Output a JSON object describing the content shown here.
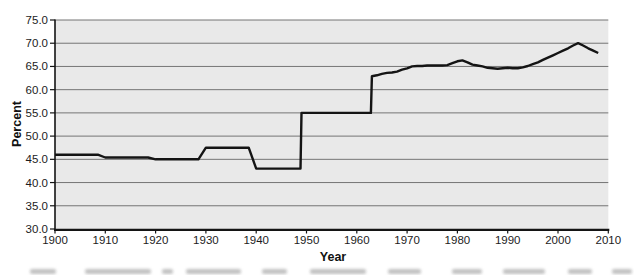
{
  "chart_data": {
    "type": "line",
    "xlabel": "Year",
    "ylabel": "Percent",
    "xlim": [
      1900,
      2010
    ],
    "ylim": [
      30,
      75
    ],
    "grid": "horizontal",
    "legend": "none",
    "x_tick_values": [
      1900,
      1910,
      1920,
      1930,
      1940,
      1950,
      1960,
      1970,
      1980,
      1990,
      2000,
      2010
    ],
    "x_tick_labels": [
      "1900",
      "1910",
      "1920",
      "1930",
      "1940",
      "1950",
      "1960",
      "1970",
      "1980",
      "1990",
      "2000",
      "2010"
    ],
    "y_tick_values": [
      30,
      35,
      40,
      45,
      50,
      55,
      60,
      65,
      70,
      75
    ],
    "y_tick_labels": [
      "30.0",
      "35.0",
      "40.0",
      "45.0",
      "50.0",
      "55.0",
      "60.0",
      "65.0",
      "70.0",
      "75.0"
    ],
    "colors": {
      "plot_bg": "#e9e9e9",
      "gridline": "#757575",
      "axis": "#141414",
      "line": "#141414",
      "text": "#1c1c1c"
    },
    "series": [
      {
        "name": "Percent",
        "points": [
          [
            1900,
            46.0
          ],
          [
            1908.5,
            46.0
          ],
          [
            1910,
            45.4
          ],
          [
            1918.5,
            45.4
          ],
          [
            1920,
            45.0
          ],
          [
            1928.5,
            45.0
          ],
          [
            1930,
            47.5
          ],
          [
            1938.5,
            47.5
          ],
          [
            1940,
            43.0
          ],
          [
            1948.8,
            43.0
          ],
          [
            1949,
            55.0
          ],
          [
            1962.8,
            55.0
          ],
          [
            1963,
            62.9
          ],
          [
            1964,
            63.1
          ],
          [
            1965,
            63.4
          ],
          [
            1966,
            63.6
          ],
          [
            1967,
            63.7
          ],
          [
            1968,
            63.9
          ],
          [
            1969,
            64.3
          ],
          [
            1970,
            64.6
          ],
          [
            1971,
            65.0
          ],
          [
            1972,
            65.1
          ],
          [
            1973,
            65.1
          ],
          [
            1974,
            65.2
          ],
          [
            1975,
            65.2
          ],
          [
            1976,
            65.2
          ],
          [
            1977,
            65.2
          ],
          [
            1978,
            65.3
          ],
          [
            1979,
            65.7
          ],
          [
            1980,
            66.1
          ],
          [
            1981,
            66.3
          ],
          [
            1982,
            65.9
          ],
          [
            1983,
            65.4
          ],
          [
            1984,
            65.2
          ],
          [
            1985,
            65.0
          ],
          [
            1986,
            64.7
          ],
          [
            1987,
            64.6
          ],
          [
            1988,
            64.5
          ],
          [
            1989,
            64.6
          ],
          [
            1990,
            64.7
          ],
          [
            1991,
            64.6
          ],
          [
            1992,
            64.6
          ],
          [
            1993,
            64.8
          ],
          [
            1994,
            65.1
          ],
          [
            1995,
            65.5
          ],
          [
            1996,
            65.9
          ],
          [
            1997,
            66.4
          ],
          [
            1998,
            66.9
          ],
          [
            1999,
            67.4
          ],
          [
            2000,
            67.9
          ],
          [
            2001,
            68.4
          ],
          [
            2002,
            68.9
          ],
          [
            2003,
            69.5
          ],
          [
            2004,
            70.0
          ],
          [
            2005,
            69.5
          ],
          [
            2006,
            68.9
          ],
          [
            2007,
            68.4
          ],
          [
            2008,
            67.9
          ]
        ]
      }
    ]
  }
}
